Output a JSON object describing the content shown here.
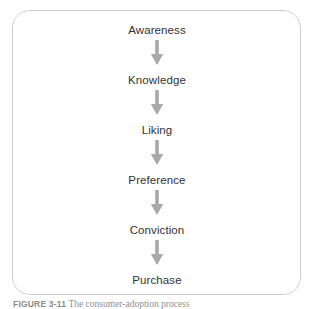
{
  "figure": {
    "panel_border_color": "#cfcfcf",
    "background_color": "#ffffff",
    "label_color": "#333333",
    "arrow_color": "#a8a8a8"
  },
  "diagram": {
    "type": "linear-flow",
    "orientation": "vertical",
    "title": "",
    "stages": [
      {
        "label": "Awareness"
      },
      {
        "label": "Knowledge"
      },
      {
        "label": "Liking"
      },
      {
        "label": "Preference"
      },
      {
        "label": "Conviction"
      },
      {
        "label": "Purchase"
      }
    ],
    "connectors": [
      {
        "icon": "arrow-down-icon"
      },
      {
        "icon": "arrow-down-icon"
      },
      {
        "icon": "arrow-down-icon"
      },
      {
        "icon": "arrow-down-icon"
      },
      {
        "icon": "arrow-down-icon"
      }
    ]
  },
  "caption": {
    "figure_number": "FIGURE 3-11",
    "text": "The consumer-adoption process"
  }
}
